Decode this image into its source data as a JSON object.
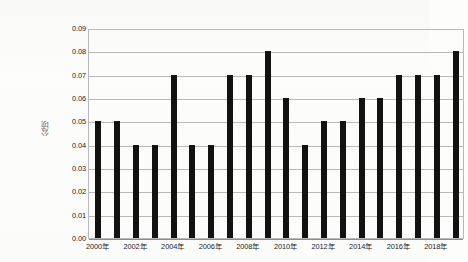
{
  "chart_data": {
    "type": "bar",
    "title": "",
    "subtitle": "",
    "xlabel": "",
    "ylabel": "公顷",
    "categories": [
      "2000年",
      "2001年",
      "2002年",
      "2003年",
      "2004年",
      "2005年",
      "2006年",
      "2007年",
      "2008年",
      "2009年",
      "2010年",
      "2011年",
      "2012年",
      "2013年",
      "2014年",
      "2015年",
      "2016年",
      "2017年",
      "2018年",
      "2019年"
    ],
    "values": [
      0.05,
      0.05,
      0.04,
      0.04,
      0.07,
      0.04,
      0.04,
      0.07,
      0.07,
      0.08,
      0.06,
      0.04,
      0.05,
      0.05,
      0.06,
      0.06,
      0.07,
      0.07,
      0.07,
      0.08
    ],
    "ylim": [
      0.0,
      0.09
    ],
    "ytick_step": 0.01,
    "ytick_labels": [
      "0.00",
      "0.01",
      "0.02",
      "0.03",
      "0.04",
      "0.05",
      "0.06",
      "0.07",
      "0.08",
      "0.09"
    ],
    "visible_xtick_labels": [
      "2000年",
      "2002年",
      "2004年",
      "2006年",
      "2008年",
      "2010年",
      "2012年",
      "2014年",
      "2016年",
      "2018年"
    ],
    "visible_xtick_indices": [
      0,
      2,
      4,
      6,
      8,
      10,
      12,
      14,
      16,
      18
    ],
    "grid": true,
    "grid_axis": "y",
    "legend": false,
    "legend_position": "none",
    "bar_color": "#121212",
    "grid_color": "#b9b9bb",
    "axis_color": "#8e8e90"
  },
  "caption": {
    "text": ""
  }
}
